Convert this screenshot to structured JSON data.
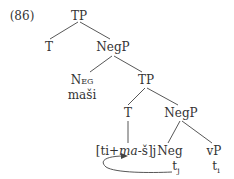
{
  "example": {
    "number": "(86)"
  },
  "tree": {
    "root": "TP",
    "t_top": "T",
    "negp_top": "NegP",
    "neg_head": "Neg",
    "neg_word": "maši",
    "tp_mid": "TP",
    "t_mid": "T",
    "t_mid_content_pre": "[ti+",
    "t_mid_content_ital": "ma",
    "t_mid_content_post": "-š]j",
    "negp_low": "NegP",
    "neg_low": "Neg",
    "vp": "vP",
    "trace_j": "t",
    "trace_j_sub": "j",
    "trace_i": "t",
    "trace_i_sub": "i"
  }
}
